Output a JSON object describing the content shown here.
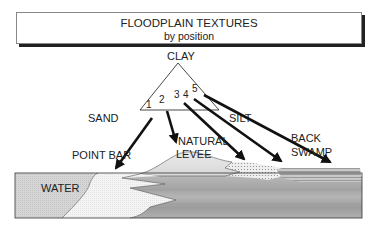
{
  "title": {
    "main": "FLOODPLAIN TEXTURES",
    "sub": "by position"
  },
  "triangle": {
    "apex_label": "CLAY",
    "left_label": "SAND",
    "right_label": "SILT",
    "positions": [
      "1",
      "2",
      "3",
      "4",
      "5"
    ]
  },
  "features": {
    "point_bar": "POINT BAR",
    "natural_levee_line1": "NATURAL",
    "natural_levee_line2": "LEVEE",
    "back_swamp_line1": "BACK",
    "back_swamp_line2": "SWAMP",
    "water": "WATER"
  },
  "colors": {
    "ink": "#222222",
    "water_fill": "#d8d8d8",
    "point_bar_fill": "#f2f2f2",
    "levee_fill": "#e6e6e6",
    "silt_fill": "#bdbdbd",
    "clay_fill": "#a8a8a8"
  }
}
